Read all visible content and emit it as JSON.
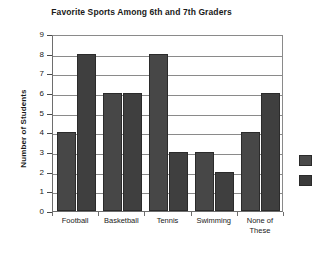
{
  "chart_data": {
    "type": "bar",
    "title": "Favorite Sports Among 6th and 7th Graders",
    "xlabel": "",
    "ylabel": "Number of Students",
    "categories": [
      "Football",
      "Basketball",
      "Tennis",
      "Swimming",
      "None of These"
    ],
    "series": [
      {
        "name": "6th Graders",
        "values": [
          4,
          6,
          8,
          3,
          4
        ],
        "color": "#474747"
      },
      {
        "name": "7th Graders",
        "values": [
          8,
          6,
          3,
          2,
          6
        ],
        "color": "#3f3f3f"
      }
    ],
    "ylim": [
      0,
      9
    ],
    "y_ticks": [
      0,
      1,
      2,
      3,
      4,
      5,
      6,
      7,
      8,
      9
    ],
    "y_tick_labels": [
      "0",
      "1",
      "2",
      "3",
      "4",
      "5",
      "6",
      "7",
      "8",
      "9"
    ],
    "grid": true,
    "grid_axis": "y",
    "legend_position": "right",
    "legend_labels_visible": false
  },
  "legend": {
    "swatches": [
      {
        "name": "series-1-swatch",
        "color": "#4a4a4a",
        "label": ""
      },
      {
        "name": "series-2-swatch",
        "color": "#3b3b3b",
        "label": ""
      }
    ]
  },
  "x_labels_wrapped": [
    [
      "Football"
    ],
    [
      "Basketball"
    ],
    [
      "Tennis"
    ],
    [
      "Swimming"
    ],
    [
      "None of",
      "These"
    ]
  ]
}
